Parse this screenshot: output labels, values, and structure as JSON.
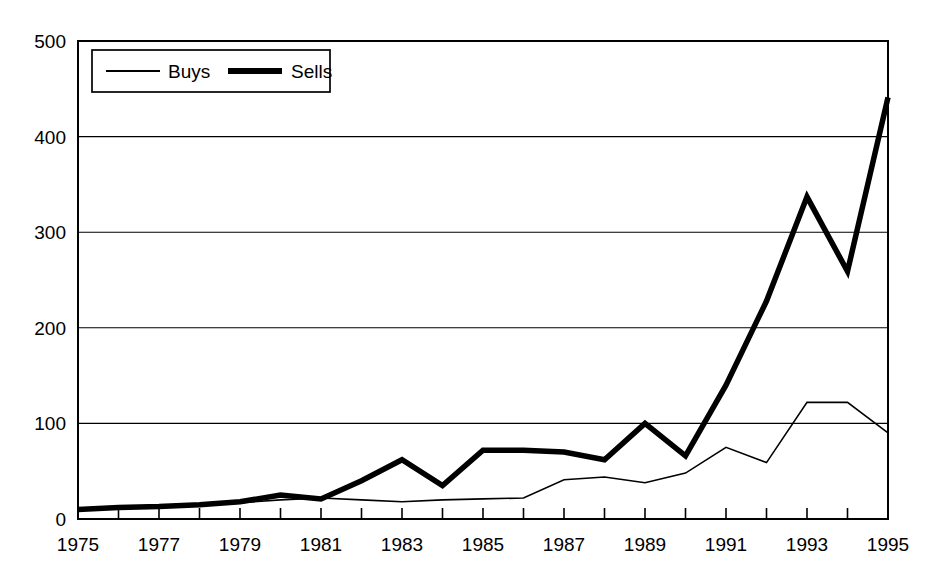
{
  "chart_data": {
    "type": "line",
    "title": "",
    "xlabel": "",
    "ylabel": "",
    "xlim": [
      1975,
      1995
    ],
    "ylim": [
      0,
      500
    ],
    "yticks": [
      0,
      100,
      200,
      300,
      400,
      500
    ],
    "ytick_labels": [
      "0",
      "100",
      "200",
      "300",
      "400",
      "500"
    ],
    "xticks": [
      1975,
      1976,
      1977,
      1978,
      1979,
      1980,
      1981,
      1982,
      1983,
      1984,
      1985,
      1986,
      1987,
      1988,
      1989,
      1990,
      1991,
      1992,
      1993,
      1994,
      1995
    ],
    "xtick_labels": [
      "1975",
      "",
      "1977",
      "",
      "1979",
      "",
      "1981",
      "",
      "1983",
      "",
      "1985",
      "",
      "1987",
      "",
      "1989",
      "",
      "1991",
      "",
      "1993",
      "",
      "1995"
    ],
    "x": [
      1975,
      1976,
      1977,
      1978,
      1979,
      1980,
      1981,
      1982,
      1983,
      1984,
      1985,
      1986,
      1987,
      1988,
      1989,
      1990,
      1991,
      1992,
      1993,
      1994,
      1995
    ],
    "grid": "horizontal",
    "legend_position": "top-left",
    "series": [
      {
        "name": "Buys",
        "line_width": 1.6,
        "color": "#000000",
        "values": [
          10,
          11,
          12,
          14,
          17,
          20,
          22,
          20,
          18,
          20,
          21,
          22,
          41,
          44,
          38,
          48,
          75,
          59,
          122,
          122,
          90
        ]
      },
      {
        "name": "Sells",
        "line_width": 5.5,
        "color": "#000000",
        "values": [
          10,
          12,
          13,
          15,
          18,
          25,
          21,
          40,
          62,
          35,
          72,
          72,
          70,
          62,
          100,
          66,
          140,
          228,
          337,
          259,
          441
        ]
      }
    ]
  },
  "legend": {
    "entries": [
      {
        "label": "Buys",
        "style": "thin"
      },
      {
        "label": "Sells",
        "style": "thick"
      }
    ]
  }
}
